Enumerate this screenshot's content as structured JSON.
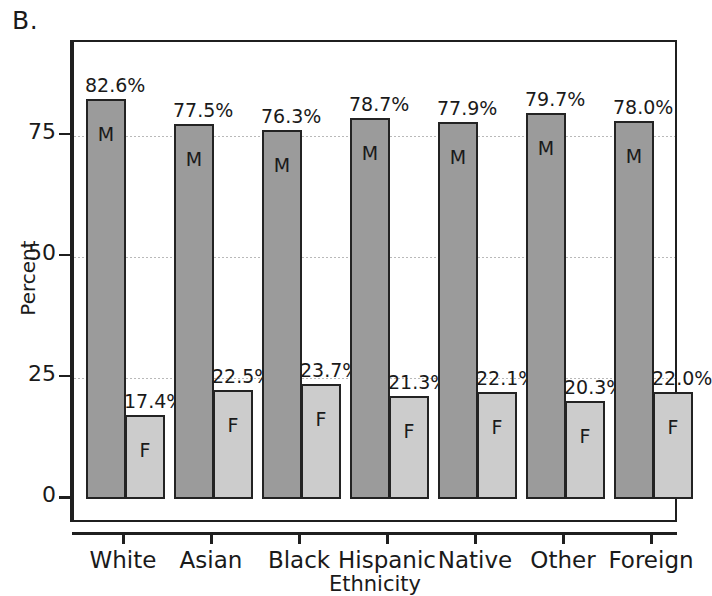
{
  "panel": {
    "letter": "B."
  },
  "chart_data": {
    "type": "bar",
    "title": "",
    "xlabel": "Ethnicity",
    "ylabel": "Percent",
    "ylim": [
      0,
      90
    ],
    "yticks": [
      0,
      25,
      50,
      75
    ],
    "ytick_labels": [
      "0",
      "25",
      "50",
      "75"
    ],
    "grid": true,
    "grid_axis": "y",
    "legend": "none",
    "categories": [
      "White",
      "Asian",
      "Black",
      "Hispanic",
      "Native",
      "Other",
      "Foreign"
    ],
    "series": [
      {
        "name": "M",
        "inner_label": "M",
        "color": "#9b9b9b",
        "values": [
          82.6,
          77.5,
          76.3,
          78.7,
          77.9,
          79.7,
          78.0
        ],
        "value_labels": [
          "82.6%",
          "77.5%",
          "76.3%",
          "78.7%",
          "77.9%",
          "79.7%",
          "78.0%"
        ]
      },
      {
        "name": "F",
        "inner_label": "F",
        "color": "#cccccc",
        "values": [
          17.4,
          22.5,
          23.7,
          21.3,
          22.1,
          20.3,
          22.0
        ],
        "value_labels": [
          "17.4%",
          "22.5%",
          "23.7%",
          "21.3%",
          "22.1%",
          "20.3%",
          "22.0%"
        ]
      }
    ]
  }
}
